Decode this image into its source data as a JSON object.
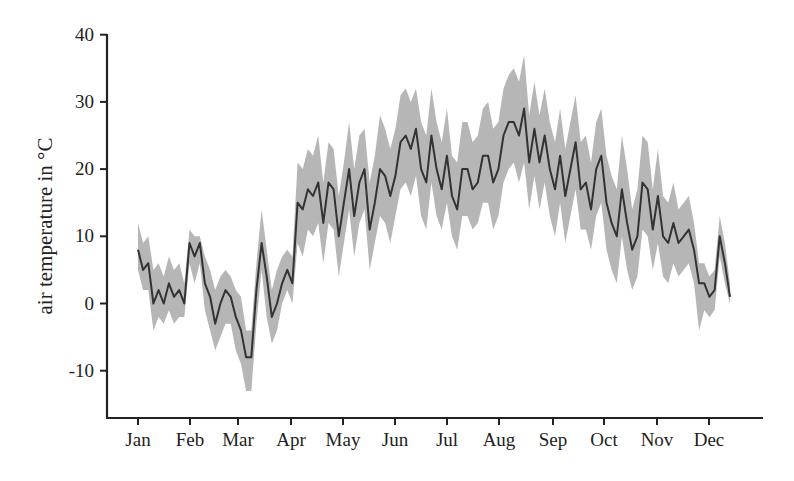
{
  "chart_data": {
    "type": "line",
    "title": "",
    "xlabel": "",
    "ylabel": "air temperature in °C",
    "ylim": [
      -17,
      40
    ],
    "yticks": [
      40,
      30,
      20,
      10,
      0,
      -10
    ],
    "ytick_labels": [
      "40",
      "30",
      "20",
      "10",
      "0",
      "-10"
    ],
    "xticks": [
      "Jan",
      "Feb",
      "Mar",
      "Apr",
      "May",
      "Jun",
      "Jul",
      "Aug",
      "Sep",
      "Oct",
      "Nov",
      "Dec"
    ],
    "grid": false,
    "legend": null,
    "series": [
      {
        "name": "mean air temperature",
        "style": "dark line",
        "color": "#333333",
        "x_day": [
          0,
          3,
          6,
          9,
          12,
          15,
          18,
          21,
          24,
          27,
          30,
          33,
          36,
          39,
          42,
          45,
          48,
          51,
          54,
          57,
          60,
          63,
          66,
          69,
          72,
          75,
          78,
          81,
          84,
          87,
          90,
          93,
          96,
          99,
          102,
          105,
          108,
          111,
          114,
          117,
          120,
          123,
          126,
          129,
          132,
          135,
          138,
          141,
          144,
          147,
          150,
          153,
          156,
          159,
          162,
          165,
          168,
          171,
          174,
          177,
          180,
          183,
          186,
          189,
          192,
          195,
          198,
          201,
          204,
          207,
          210,
          213,
          216,
          219,
          222,
          225,
          228,
          231,
          234,
          237,
          240,
          243,
          246,
          249,
          252,
          255,
          258,
          261,
          264,
          267,
          270,
          273,
          276,
          279,
          282,
          285,
          288,
          291,
          294,
          297,
          300,
          303,
          306,
          309,
          312,
          315,
          318,
          321,
          324,
          327,
          330,
          333,
          336,
          339,
          342,
          345
        ],
        "values": [
          8,
          5,
          6,
          0,
          2,
          0,
          3,
          1,
          2,
          0,
          9,
          7,
          9,
          3,
          1,
          -3,
          0,
          2,
          1,
          -2,
          -4,
          -8,
          -8,
          2,
          9,
          4,
          -2,
          0,
          3,
          5,
          3,
          15,
          14,
          17,
          16,
          18,
          12,
          18,
          17,
          10,
          15,
          20,
          13,
          18,
          20,
          11,
          15,
          20,
          19,
          16,
          19,
          24,
          25,
          23,
          26,
          20,
          18,
          25,
          20,
          17,
          22,
          16,
          14,
          20,
          20,
          17,
          18,
          22,
          22,
          18,
          20,
          25,
          27,
          27,
          25,
          29,
          21,
          26,
          21,
          25,
          20,
          17,
          22,
          16,
          20,
          24,
          17,
          18,
          14,
          20,
          22,
          15,
          12,
          10,
          17,
          12,
          8,
          10,
          18,
          17,
          11,
          16,
          10,
          9,
          12,
          9,
          10,
          11,
          8,
          3,
          3,
          1,
          2,
          10,
          6,
          1
        ],
        "band_upper": [
          12,
          9,
          10,
          5,
          6,
          4,
          7,
          5,
          6,
          3,
          11,
          10,
          10,
          7,
          5,
          2,
          4,
          5,
          4,
          2,
          1,
          -4,
          -4,
          6,
          14,
          8,
          2,
          5,
          7,
          8,
          7,
          21,
          20,
          23,
          22,
          25,
          18,
          24,
          23,
          16,
          21,
          27,
          20,
          25,
          26,
          18,
          22,
          28,
          26,
          23,
          26,
          31,
          32,
          30,
          32,
          27,
          25,
          32,
          27,
          24,
          29,
          22,
          21,
          27,
          27,
          24,
          25,
          29,
          30,
          26,
          27,
          32,
          34,
          35,
          33,
          37,
          28,
          33,
          28,
          32,
          27,
          24,
          29,
          23,
          27,
          31,
          24,
          25,
          21,
          27,
          29,
          22,
          19,
          17,
          25,
          20,
          14,
          17,
          25,
          24,
          17,
          23,
          16,
          15,
          18,
          14,
          15,
          16,
          12,
          6,
          6,
          4,
          5,
          13,
          9,
          3
        ],
        "band_lower": [
          5,
          2,
          2,
          -4,
          -2,
          -3,
          -1,
          -3,
          -2,
          -2,
          6,
          3,
          6,
          -1,
          -4,
          -7,
          -5,
          -3,
          -3,
          -7,
          -9,
          -13,
          -13,
          -3,
          5,
          -2,
          -6,
          -4,
          0,
          2,
          0,
          9,
          7,
          11,
          10,
          12,
          6,
          12,
          11,
          4,
          9,
          14,
          7,
          12,
          14,
          5,
          9,
          13,
          12,
          9,
          13,
          17,
          18,
          16,
          19,
          13,
          11,
          18,
          13,
          11,
          15,
          10,
          8,
          13,
          13,
          11,
          12,
          15,
          15,
          11,
          13,
          18,
          20,
          21,
          18,
          21,
          14,
          19,
          14,
          18,
          13,
          10,
          15,
          9,
          13,
          17,
          11,
          11,
          8,
          13,
          15,
          8,
          5,
          3,
          10,
          5,
          2,
          4,
          11,
          10,
          5,
          9,
          4,
          3,
          6,
          4,
          5,
          6,
          3,
          -4,
          -1,
          -2,
          -1,
          7,
          3,
          0
        ]
      }
    ]
  },
  "axes": {
    "y_title": "air temperature in °C"
  }
}
